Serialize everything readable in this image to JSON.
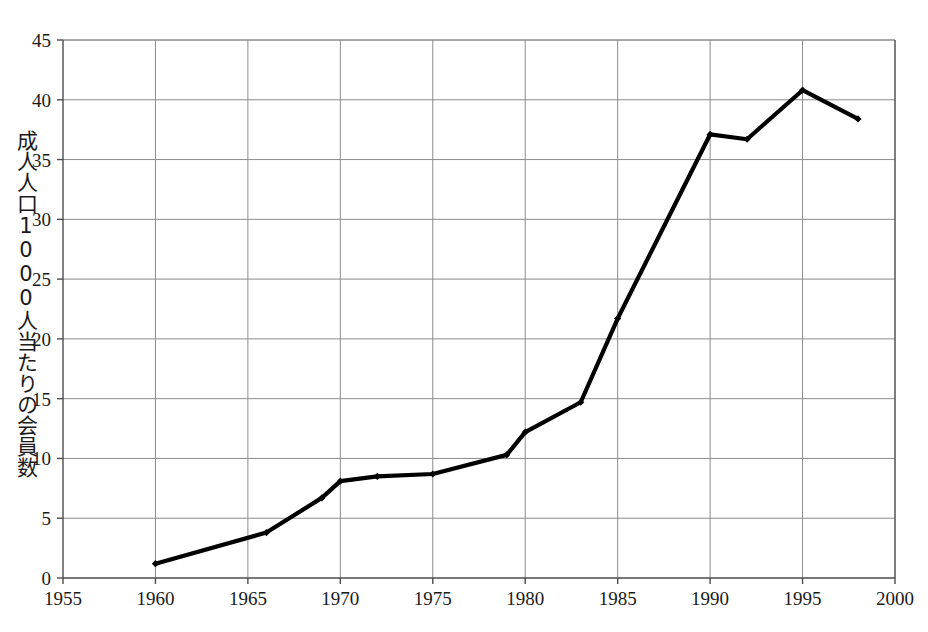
{
  "chart_data": {
    "type": "line",
    "title": "",
    "xlabel": "",
    "ylabel": "成人人口1000人当たりの会員数",
    "xlim": [
      1955,
      2000
    ],
    "ylim": [
      0,
      45
    ],
    "xticks": [
      1955,
      1960,
      1965,
      1970,
      1975,
      1980,
      1985,
      1990,
      1995,
      2000
    ],
    "xtick_labels": [
      "1955",
      "1960",
      "1965",
      "1970",
      "1975",
      "1980",
      "1985",
      "1990",
      "1995",
      "2000"
    ],
    "yticks": [
      0,
      5,
      10,
      15,
      20,
      25,
      30,
      35,
      40,
      45
    ],
    "ytick_labels": [
      "0",
      "5",
      "10",
      "15",
      "20",
      "25",
      "30",
      "35",
      "40",
      "45"
    ],
    "grid": true,
    "legend": null,
    "series": [
      {
        "name": "成人人口1000人当たりの会員数",
        "color": "#000000",
        "marker": "diamond",
        "x": [
          1960,
          1966,
          1969,
          1970,
          1972,
          1975,
          1979,
          1980,
          1983,
          1985,
          1990,
          1992,
          1995,
          1998
        ],
        "values": [
          1.2,
          3.8,
          6.7,
          8.1,
          8.5,
          8.7,
          10.3,
          12.2,
          14.7,
          21.7,
          37.1,
          36.7,
          40.8,
          38.4
        ]
      }
    ]
  },
  "axes": {
    "grid_color": "#8c8c8c",
    "axis_color": "#4d4d4d",
    "background": "#ffffff"
  }
}
